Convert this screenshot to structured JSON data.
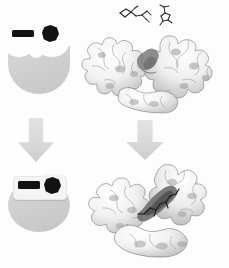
{
  "figure": {
    "background_color": "#fdfdfd",
    "rows": [
      {
        "id": "row-open",
        "state_label": "open / unbound",
        "schematic": {
          "enzyme_label": "open enzyme",
          "enzyme_color": "#cfcfcf",
          "pockets": 2,
          "ligands": [
            {
              "name": "ligand-bar",
              "shape": "rectangle",
              "color": "#121212",
              "bound": false
            },
            {
              "name": "ligand-polygon",
              "shape": "heptagon",
              "color": "#121212",
              "bound": false
            }
          ]
        },
        "structure": {
          "name": "open-protein-surface",
          "render_style": "molecular surface",
          "palette": "greyscale",
          "lobes": 2,
          "cleft": "wide open"
        },
        "free_ligand_models": [
          {
            "name": "ligand-stick-model-1",
            "style": "stick",
            "color": "#2a2a2a"
          },
          {
            "name": "ligand-stick-model-2",
            "style": "stick",
            "color": "#2a2a2a"
          }
        ]
      },
      {
        "id": "row-closed",
        "state_label": "closed / bound",
        "schematic": {
          "enzyme_label": "closed enzyme",
          "enzyme_color": "#cfcfcf",
          "pockets": 0,
          "ligands": [
            {
              "name": "ligand-bar",
              "shape": "rectangle",
              "color": "#121212",
              "bound": true
            },
            {
              "name": "ligand-polygon",
              "shape": "heptagon",
              "color": "#121212",
              "bound": true
            }
          ]
        },
        "structure": {
          "name": "closed-protein-surface",
          "render_style": "molecular surface",
          "palette": "greyscale",
          "lobes": 2,
          "cleft": "closed around ligand"
        }
      }
    ],
    "arrows": [
      {
        "name": "transition-arrow-left",
        "direction": "down",
        "color": "#d9d9d9"
      },
      {
        "name": "transition-arrow-right",
        "direction": "down",
        "color": "#d9d9d9"
      }
    ],
    "colors": {
      "enzyme_grey": "#cfcfcf",
      "ligand_black": "#121212",
      "arrow_grey": "#d9d9d9",
      "surface_outline": "#6f6f6f",
      "surface_fill": "#fbfbfb"
    }
  }
}
